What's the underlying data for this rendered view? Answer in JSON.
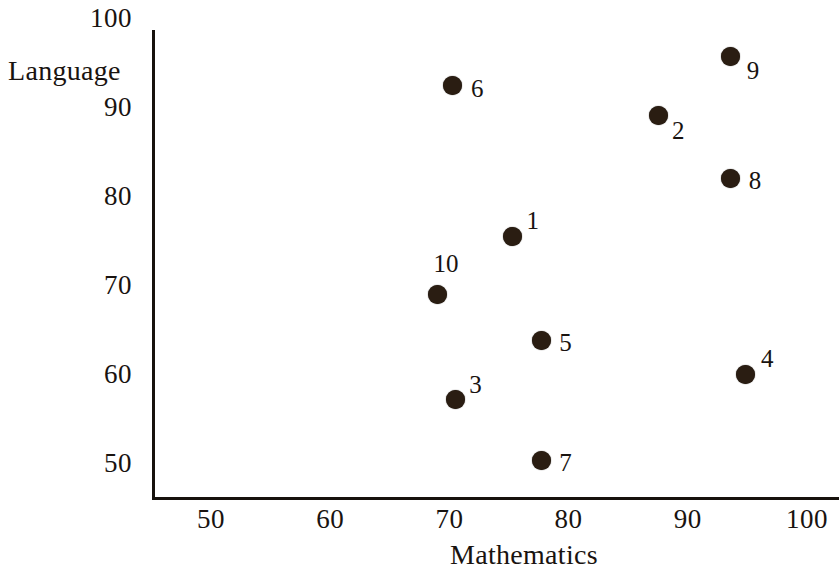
{
  "chart_data": {
    "type": "scatter",
    "title": "",
    "xlabel": "Mathematics",
    "ylabel": "Language",
    "xlim": [
      45,
      103
    ],
    "ylim": [
      46.5,
      101
    ],
    "grid": false,
    "legend": "none",
    "xticks": [
      "50",
      "60",
      "70",
      "80",
      "90",
      "100"
    ],
    "xtick_values": [
      50,
      60,
      70,
      80,
      90,
      100
    ],
    "yticks": [
      "100",
      "90",
      "80",
      "70",
      "60",
      "50"
    ],
    "ytick_values": [
      100,
      90,
      80,
      70,
      60,
      50
    ],
    "point_label_field": "id",
    "points": [
      {
        "id": "1",
        "x": 75.3,
        "y": 75.5,
        "label_dx": 14,
        "label_dy": -16
      },
      {
        "id": "2",
        "x": 87.5,
        "y": 89.0,
        "label_dx": 14,
        "label_dy": 14
      },
      {
        "id": "3",
        "x": 70.5,
        "y": 57.1,
        "label_dx": 14,
        "label_dy": -16
      },
      {
        "id": "4",
        "x": 94.8,
        "y": 60.0,
        "label_dx": 16,
        "label_dy": -16
      },
      {
        "id": "5",
        "x": 77.7,
        "y": 63.8,
        "label_dx": 18,
        "label_dy": 2
      },
      {
        "id": "6",
        "x": 70.3,
        "y": 92.4,
        "label_dx": 18,
        "label_dy": 2
      },
      {
        "id": "7",
        "x": 77.7,
        "y": 50.3,
        "label_dx": 18,
        "label_dy": 2
      },
      {
        "id": "8",
        "x": 93.6,
        "y": 82.0,
        "label_dx": 18,
        "label_dy": 2
      },
      {
        "id": "9",
        "x": 93.6,
        "y": 95.7,
        "label_dx": 16,
        "label_dy": 14
      },
      {
        "id": "10",
        "x": 69.0,
        "y": 68.9,
        "label_dx": -4,
        "label_dy": -32
      }
    ],
    "marker_color": "#2a1d12",
    "axis_color": "#17120d",
    "text_color": "#191310"
  }
}
